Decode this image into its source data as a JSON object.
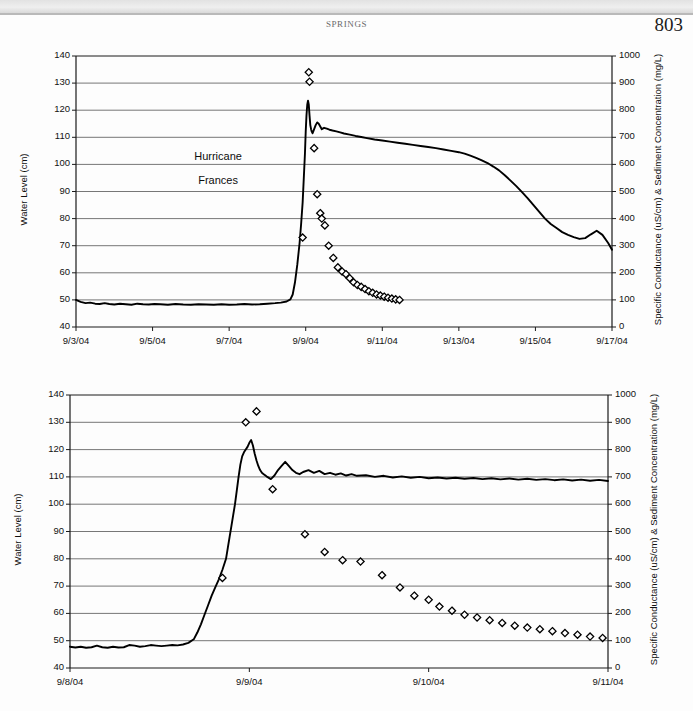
{
  "page": {
    "running_head": "SPRINGS",
    "folio": "803"
  },
  "charts": [
    {
      "id": "chart-top",
      "axis": {
        "y_left_title": "Water Level (cm)",
        "y_right_title": "Specific Conductance (uS/cm) & Sediment Concentration (mg/L)",
        "y_left_ticks": [
          "40",
          "50",
          "60",
          "70",
          "80",
          "90",
          "100",
          "110",
          "120",
          "130",
          "140"
        ],
        "y_right_ticks": [
          "0",
          "100",
          "200",
          "300",
          "400",
          "500",
          "600",
          "700",
          "800",
          "900",
          "1000"
        ],
        "x_ticks": [
          "9/3/04",
          "9/5/04",
          "9/7/04",
          "9/9/04",
          "9/11/04",
          "9/13/04",
          "9/15/04",
          "9/17/04"
        ]
      },
      "annotations": [
        {
          "text": "Hurricane",
          "x_frac": 0.265,
          "y_value": 102.5
        },
        {
          "text": "Frances",
          "x_frac": 0.265,
          "y_value": 93.5
        }
      ]
    },
    {
      "id": "chart-bottom",
      "axis": {
        "y_left_title": "Water Level (cm)",
        "y_right_title": "Specific Conductance (uS/cm) & Sediment Concentration (mg/L)",
        "y_left_ticks": [
          "40",
          "50",
          "60",
          "70",
          "80",
          "90",
          "100",
          "110",
          "120",
          "130",
          "140"
        ],
        "y_right_ticks": [
          "0",
          "100",
          "200",
          "300",
          "400",
          "500",
          "600",
          "700",
          "800",
          "900",
          "1000"
        ],
        "x_ticks": [
          "9/8/04",
          "9/9/04",
          "9/10/04",
          "9/11/04"
        ]
      },
      "annotations": []
    }
  ],
  "chart_data": [
    {
      "type": "line",
      "id": "chart-top",
      "title": "",
      "xlabel": "",
      "ylabel": "Water Level (cm)",
      "y2label": "Specific Conductance (uS/cm) & Sediment Concentration (mg/L)",
      "xlim": [
        0,
        14
      ],
      "ylim": [
        40,
        140
      ],
      "y2lim": [
        0,
        1000
      ],
      "xtick_values": [
        0,
        2,
        4,
        6,
        8,
        10,
        12,
        14
      ],
      "xtick_labels": [
        "9/3/04",
        "9/5/04",
        "9/7/04",
        "9/9/04",
        "9/11/04",
        "9/13/04",
        "9/15/04",
        "9/17/04"
      ],
      "ytick_values": [
        40,
        50,
        60,
        70,
        80,
        90,
        100,
        110,
        120,
        130,
        140
      ],
      "y2tick_values": [
        0,
        100,
        200,
        300,
        400,
        500,
        600,
        700,
        800,
        900,
        1000
      ],
      "grid": "horizontal",
      "legend": "none",
      "annotations": [
        "Hurricane",
        "Frances"
      ],
      "series": [
        {
          "name": "Water Level",
          "axis": "left",
          "style": "line",
          "x": [
            0.0,
            0.12,
            0.25,
            0.37,
            0.5,
            0.62,
            0.75,
            0.87,
            1.0,
            1.15,
            1.3,
            1.45,
            1.6,
            1.75,
            1.9,
            2.05,
            2.2,
            2.4,
            2.6,
            2.8,
            3.0,
            3.2,
            3.4,
            3.6,
            3.8,
            4.0,
            4.2,
            4.4,
            4.6,
            4.8,
            5.0,
            5.2,
            5.35,
            5.5,
            5.6,
            5.66,
            5.72,
            5.78,
            5.84,
            5.88,
            5.92,
            5.95,
            5.98,
            6.0,
            6.02,
            6.04,
            6.06,
            6.08,
            6.1,
            6.12,
            6.14,
            6.16,
            6.18,
            6.22,
            6.26,
            6.3,
            6.34,
            6.38,
            6.42,
            6.48,
            6.55,
            6.62,
            6.7,
            6.8,
            6.9,
            7.0,
            7.15,
            7.3,
            7.45,
            7.6,
            7.8,
            8.0,
            8.2,
            8.4,
            8.6,
            8.8,
            9.0,
            9.2,
            9.4,
            9.6,
            9.8,
            10.0,
            10.15,
            10.3,
            10.45,
            10.6,
            10.75,
            10.9,
            11.05,
            11.2,
            11.35,
            11.5,
            11.65,
            11.8,
            11.95,
            12.1,
            12.25,
            12.4,
            12.55,
            12.7,
            12.85,
            13.0,
            13.15,
            13.3,
            13.45,
            13.6,
            13.75,
            13.9,
            14.0
          ],
          "y": [
            50.0,
            49.3,
            48.8,
            49.0,
            48.6,
            48.5,
            48.8,
            48.5,
            48.3,
            48.6,
            48.4,
            48.2,
            48.6,
            48.4,
            48.3,
            48.5,
            48.4,
            48.2,
            48.5,
            48.3,
            48.2,
            48.4,
            48.3,
            48.2,
            48.4,
            48.2,
            48.3,
            48.5,
            48.3,
            48.4,
            48.6,
            48.8,
            49.0,
            49.4,
            50.2,
            52.0,
            56.5,
            63.0,
            71.0,
            78.0,
            86.0,
            95.0,
            104.0,
            112.0,
            118.0,
            122.0,
            123.5,
            122.0,
            118.0,
            114.5,
            113.0,
            112.0,
            111.5,
            113.0,
            114.5,
            115.5,
            115.0,
            114.0,
            113.0,
            113.5,
            113.2,
            112.8,
            112.5,
            112.2,
            111.8,
            111.4,
            111.0,
            110.5,
            110.1,
            109.7,
            109.2,
            108.8,
            108.4,
            108.0,
            107.6,
            107.2,
            106.8,
            106.4,
            106.0,
            105.5,
            105.0,
            104.5,
            104.0,
            103.2,
            102.4,
            101.5,
            100.5,
            99.2,
            97.8,
            96.0,
            94.0,
            92.0,
            89.8,
            87.5,
            85.0,
            82.5,
            80.0,
            78.0,
            76.5,
            75.0,
            74.0,
            73.2,
            72.5,
            72.8,
            74.2,
            75.5,
            74.0,
            71.0,
            68.5
          ],
          "value_range_note": "water level rises from ~48 cm baseline to peak 123.5 cm on 9/9/04 then recedes to ~68 cm by 9/17/04"
        },
        {
          "name": "Specific Conductance & Sediment Concentration",
          "axis": "right",
          "style": "markers",
          "marker": "open-diamond",
          "x": [
            5.92,
            6.08,
            6.1,
            6.22,
            6.3,
            6.38,
            6.42,
            6.5,
            6.6,
            6.72,
            6.84,
            6.95,
            7.05,
            7.15,
            7.25,
            7.35,
            7.45,
            7.55,
            7.65,
            7.75,
            7.85,
            7.95,
            8.05,
            8.15,
            8.25,
            8.35,
            8.45
          ],
          "y": [
            330,
            940,
            905,
            660,
            490,
            420,
            400,
            375,
            300,
            255,
            220,
            205,
            195,
            180,
            165,
            155,
            148,
            140,
            132,
            126,
            120,
            116,
            112,
            108,
            105,
            102,
            100
          ],
          "value_range_note": "sediment/conductance peaks ~940 mg/L at storm crest then decays to ~100 mg/L"
        }
      ]
    },
    {
      "type": "line",
      "id": "chart-bottom",
      "title": "",
      "xlabel": "",
      "ylabel": "Water Level (cm)",
      "y2label": "Specific Conductance (uS/cm) & Sediment Concentration (mg/L)",
      "xlim": [
        0,
        3
      ],
      "ylim": [
        40,
        140
      ],
      "y2lim": [
        0,
        1000
      ],
      "xtick_values": [
        0,
        1,
        2,
        3
      ],
      "xtick_labels": [
        "9/8/04",
        "9/9/04",
        "9/10/04",
        "9/11/04"
      ],
      "ytick_values": [
        40,
        50,
        60,
        70,
        80,
        90,
        100,
        110,
        120,
        130,
        140
      ],
      "y2tick_values": [
        0,
        100,
        200,
        300,
        400,
        500,
        600,
        700,
        800,
        900,
        1000
      ],
      "grid": "horizontal",
      "legend": "none",
      "annotations": [],
      "series": [
        {
          "name": "Water Level",
          "axis": "left",
          "style": "line",
          "x": [
            0.0,
            0.03,
            0.06,
            0.09,
            0.12,
            0.15,
            0.18,
            0.21,
            0.24,
            0.27,
            0.3,
            0.33,
            0.36,
            0.39,
            0.42,
            0.45,
            0.48,
            0.51,
            0.54,
            0.57,
            0.6,
            0.63,
            0.66,
            0.69,
            0.71,
            0.73,
            0.75,
            0.77,
            0.79,
            0.81,
            0.83,
            0.85,
            0.87,
            0.88,
            0.89,
            0.9,
            0.91,
            0.92,
            0.93,
            0.94,
            0.95,
            0.96,
            0.97,
            0.98,
            0.99,
            1.0,
            1.01,
            1.02,
            1.03,
            1.04,
            1.05,
            1.06,
            1.07,
            1.08,
            1.09,
            1.1,
            1.12,
            1.14,
            1.16,
            1.18,
            1.2,
            1.22,
            1.24,
            1.26,
            1.28,
            1.3,
            1.33,
            1.36,
            1.39,
            1.42,
            1.45,
            1.48,
            1.51,
            1.54,
            1.57,
            1.6,
            1.65,
            1.7,
            1.75,
            1.8,
            1.85,
            1.9,
            1.95,
            2.0,
            2.05,
            2.1,
            2.15,
            2.2,
            2.25,
            2.3,
            2.35,
            2.4,
            2.45,
            2.5,
            2.55,
            2.6,
            2.65,
            2.7,
            2.75,
            2.8,
            2.85,
            2.9,
            2.95,
            3.0
          ],
          "y": [
            47.8,
            47.5,
            47.8,
            47.4,
            47.6,
            48.2,
            47.6,
            47.4,
            47.8,
            47.5,
            47.6,
            48.4,
            48.2,
            47.8,
            48.0,
            48.4,
            48.2,
            48.0,
            48.2,
            48.4,
            48.3,
            48.6,
            49.2,
            50.5,
            53.0,
            56.0,
            59.5,
            63.0,
            66.5,
            69.5,
            72.5,
            76.0,
            80.0,
            84.0,
            88.0,
            92.0,
            96.0,
            100.0,
            105.0,
            110.0,
            114.5,
            117.5,
            119.0,
            120.0,
            121.0,
            122.5,
            123.5,
            121.5,
            118.5,
            116.0,
            114.0,
            112.5,
            111.5,
            111.0,
            110.5,
            110.0,
            109.2,
            110.5,
            112.5,
            114.0,
            115.5,
            114.0,
            112.5,
            111.5,
            111.0,
            111.8,
            112.5,
            111.5,
            112.2,
            111.0,
            111.5,
            110.8,
            111.3,
            110.5,
            111.0,
            110.4,
            110.6,
            110.0,
            110.4,
            109.8,
            110.2,
            109.7,
            110.0,
            109.5,
            109.8,
            109.4,
            109.7,
            109.3,
            109.6,
            109.2,
            109.5,
            109.1,
            109.4,
            109.0,
            109.3,
            108.9,
            109.2,
            108.8,
            109.1,
            108.7,
            109.0,
            108.6,
            108.9,
            108.5
          ],
          "value_range_note": "detail view: baseline ~48 cm, peak 123.5 cm midday 9/9/04, settles to ~109 cm"
        },
        {
          "name": "Specific Conductance & Sediment Concentration",
          "axis": "right",
          "style": "markers",
          "marker": "open-diamond",
          "x": [
            0.85,
            0.98,
            1.04,
            1.13,
            1.31,
            1.42,
            1.52,
            1.62,
            1.74,
            1.84,
            1.92,
            2.0,
            2.06,
            2.13,
            2.2,
            2.27,
            2.34,
            2.41,
            2.48,
            2.55,
            2.62,
            2.69,
            2.76,
            2.83,
            2.9,
            2.97
          ],
          "y": [
            330,
            900,
            940,
            655,
            490,
            425,
            395,
            390,
            340,
            295,
            265,
            250,
            225,
            210,
            195,
            185,
            175,
            165,
            155,
            148,
            142,
            135,
            128,
            122,
            115,
            110
          ],
          "value_range_note": "sediment/conductance peaks ~940 mg/L at crest then decays toward ~110 mg/L by 9/11/04"
        }
      ]
    }
  ]
}
